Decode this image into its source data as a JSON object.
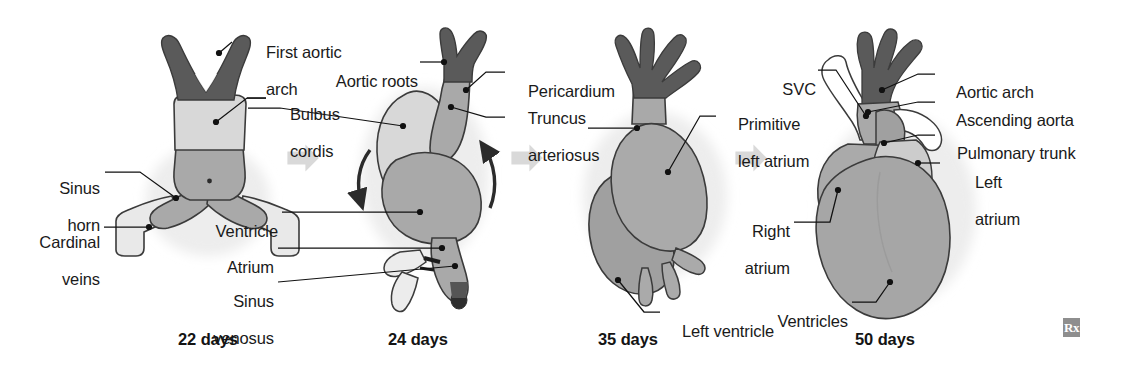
{
  "figure": {
    "background_color": "#ffffff",
    "text_color": "#1a1a1a"
  },
  "palette": {
    "dark_gray": "#5a5a5a",
    "mid_gray": "#a9a9a9",
    "light_gray": "#d6d6d6",
    "pale_gray": "#e6e6e6",
    "halo_gray": "#ededed",
    "outline": "#3b3b3b",
    "leader_line": "#111111",
    "arrow_gray": "#d9d9d9"
  },
  "stages": [
    {
      "id": "stage-22-days",
      "caption": "22 days",
      "labels": [
        {
          "id": "first-aortic-arch",
          "text": "First aortic\narch",
          "side": "right"
        },
        {
          "id": "bulbus-cordis",
          "text": "Bulbus\ncordis",
          "side": "right"
        },
        {
          "id": "sinus-horn",
          "text": "Sinus\nhorn",
          "side": "left"
        },
        {
          "id": "cardinal-veins",
          "text": "Cardinal\nveins",
          "side": "left"
        }
      ]
    },
    {
      "id": "stage-24-days",
      "caption": "24 days",
      "labels": [
        {
          "id": "aortic-roots",
          "text": "Aortic roots",
          "side": "left"
        },
        {
          "id": "pericardium",
          "text": "Pericardium",
          "side": "right"
        },
        {
          "id": "truncus-arteriosus",
          "text": "Truncus\narteriosus",
          "side": "right"
        },
        {
          "id": "ventricle",
          "text": "Ventricle",
          "side": "left"
        },
        {
          "id": "atrium",
          "text": "Atrium",
          "side": "left"
        },
        {
          "id": "sinus-venosus",
          "text": "Sinus\nvenosus",
          "side": "left"
        }
      ]
    },
    {
      "id": "stage-35-days",
      "caption": "35 days",
      "labels": [
        {
          "id": "primitive-left-atrium",
          "text": "Primitive\nleft atrium",
          "side": "right"
        },
        {
          "id": "left-ventricle",
          "text": "Left ventricle",
          "side": "right"
        }
      ]
    },
    {
      "id": "stage-50-days",
      "caption": "50 days",
      "labels": [
        {
          "id": "svc",
          "text": "SVC",
          "side": "left"
        },
        {
          "id": "aortic-arch",
          "text": "Aortic arch",
          "side": "right"
        },
        {
          "id": "ascending-aorta",
          "text": "Ascending aorta",
          "side": "right"
        },
        {
          "id": "pulmonary-trunk",
          "text": "Pulmonary trunk",
          "side": "right"
        },
        {
          "id": "left-atrium",
          "text": "Left\natrium",
          "side": "right"
        },
        {
          "id": "right-atrium",
          "text": "Right\natrium",
          "side": "left"
        },
        {
          "id": "ventricles",
          "text": "Ventricles",
          "side": "left"
        }
      ]
    }
  ],
  "labels_flat": {
    "first_aortic_arch_line1": "First aortic",
    "first_aortic_arch_line2": "arch",
    "bulbus_cordis_line1": "Bulbus",
    "bulbus_cordis_line2": "cordis",
    "sinus_horn_line1": "Sinus",
    "sinus_horn_line2": "horn",
    "cardinal_veins_line1": "Cardinal",
    "cardinal_veins_line2": "veins",
    "aortic_roots": "Aortic roots",
    "pericardium": "Pericardium",
    "truncus_line1": "Truncus",
    "truncus_line2": "arteriosus",
    "ventricle": "Ventricle",
    "atrium": "Atrium",
    "sinus_venosus_line1": "Sinus",
    "sinus_venosus_line2": "venosus",
    "primitive_line1": "Primitive",
    "primitive_line2": "left atrium",
    "left_ventricle": "Left ventricle",
    "svc": "SVC",
    "aortic_arch": "Aortic arch",
    "ascending_aorta": "Ascending aorta",
    "pulmonary_trunk": "Pulmonary trunk",
    "left_atrium_line1": "Left",
    "left_atrium_line2": "atrium",
    "right_atrium_line1": "Right",
    "right_atrium_line2": "atrium",
    "ventricles": "Ventricles"
  },
  "captions": {
    "day22": "22 days",
    "day24": "24 days",
    "day35": "35 days",
    "day50": "50 days"
  },
  "watermark": {
    "text": "Rx"
  }
}
